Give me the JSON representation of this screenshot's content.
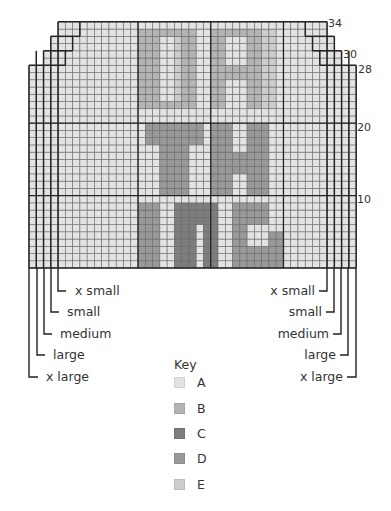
{
  "chart": {
    "columns": 45,
    "rows": 34,
    "origin_x": 29,
    "bottom_y": 268,
    "cell_w": 7.27,
    "cell_h": 7.24,
    "bold_col_lines": [
      15,
      25,
      35
    ],
    "bold_row_lines": [
      10,
      20
    ],
    "row_numbers": [
      {
        "label": "34",
        "row": 34
      },
      {
        "label": "30",
        "row": 30
      },
      {
        "label": "28",
        "row": 28
      },
      {
        "label": "20",
        "row": 20
      },
      {
        "label": "10",
        "row": 10
      }
    ],
    "size_steps": [
      {
        "size": "x large",
        "cols_inset": 0,
        "top_row": 28
      },
      {
        "size": "large",
        "cols_inset": 1,
        "top_row": 30
      },
      {
        "size": "medium",
        "cols_inset": 2,
        "top_row": 30
      },
      {
        "size": "small",
        "cols_inset": 3,
        "top_row": 32
      },
      {
        "size": "x small",
        "cols_inset": 4,
        "top_row": 34
      }
    ]
  },
  "colors": {
    "A": "#e3e3e3",
    "B": "#b4b4b4",
    "C": "#7d7d7d",
    "D": "#999999",
    "E": "#cdcdcd",
    "grid_line": "#6a6a6a",
    "bold_line": "#222222"
  },
  "motif": {
    "text_lines": [
      "DA",
      "TH",
      "INC"
    ],
    "blocks": [
      {
        "color": "B",
        "c0": 15,
        "c1": 17,
        "r0": 23,
        "r1": 33
      },
      {
        "color": "B",
        "c0": 18,
        "c1": 20,
        "r0": 23,
        "r1": 23
      },
      {
        "color": "B",
        "c0": 18,
        "c1": 20,
        "r0": 33,
        "r1": 33
      },
      {
        "color": "B",
        "c0": 21,
        "c1": 22,
        "r0": 23,
        "r1": 33
      },
      {
        "color": "E",
        "c0": 20,
        "c1": 20,
        "r0": 24,
        "r1": 32
      },
      {
        "color": "B",
        "c0": 25,
        "c1": 26,
        "r0": 23,
        "r1": 33
      },
      {
        "color": "B",
        "c0": 27,
        "c1": 29,
        "r0": 33,
        "r1": 33
      },
      {
        "color": "B",
        "c0": 27,
        "c1": 29,
        "r0": 27,
        "r1": 28
      },
      {
        "color": "B",
        "c0": 30,
        "c1": 31,
        "r0": 23,
        "r1": 33
      },
      {
        "color": "E",
        "c0": 32,
        "c1": 33,
        "r0": 23,
        "r1": 33
      },
      {
        "color": "D",
        "c0": 16,
        "c1": 23,
        "r0": 18,
        "r1": 20
      },
      {
        "color": "D",
        "c0": 18,
        "c1": 21,
        "r0": 11,
        "r1": 17
      },
      {
        "color": "D",
        "c0": 25,
        "c1": 27,
        "r0": 11,
        "r1": 20
      },
      {
        "color": "D",
        "c0": 28,
        "c1": 29,
        "r0": 14,
        "r1": 16
      },
      {
        "color": "D",
        "c0": 30,
        "c1": 32,
        "r0": 11,
        "r1": 20
      },
      {
        "color": "D",
        "c0": 15,
        "c1": 17,
        "r0": 1,
        "r1": 9
      },
      {
        "color": "C",
        "c0": 20,
        "c1": 22,
        "r0": 1,
        "r1": 9
      },
      {
        "color": "C",
        "c0": 23,
        "c1": 23,
        "r0": 7,
        "r1": 9
      },
      {
        "color": "C",
        "c0": 24,
        "c1": 25,
        "r0": 1,
        "r1": 9
      },
      {
        "color": "D",
        "c0": 28,
        "c1": 32,
        "r0": 1,
        "r1": 3
      },
      {
        "color": "D",
        "c0": 28,
        "c1": 29,
        "r0": 1,
        "r1": 9
      },
      {
        "color": "D",
        "c0": 30,
        "c1": 32,
        "r0": 7,
        "r1": 9
      },
      {
        "color": "D",
        "c0": 33,
        "c1": 34,
        "r0": 1,
        "r1": 5
      }
    ]
  },
  "size_labels": {
    "left": [
      "x small",
      "small",
      "medium",
      "large",
      "x large"
    ],
    "right": [
      "x small",
      "small",
      "medium",
      "large",
      "x large"
    ]
  },
  "key": {
    "title": "Key",
    "items": [
      {
        "label": "A",
        "color": "#e3e3e3"
      },
      {
        "label": "B",
        "color": "#b4b4b4"
      },
      {
        "label": "C",
        "color": "#7d7d7d"
      },
      {
        "label": "D",
        "color": "#999999"
      },
      {
        "label": "E",
        "color": "#cdcdcd"
      }
    ]
  }
}
